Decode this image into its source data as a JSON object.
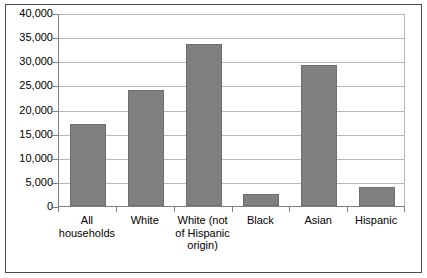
{
  "chart_data": {
    "type": "bar",
    "title": "",
    "subtitle": "",
    "xlabel": "",
    "ylabel": "",
    "categories": [
      "All households",
      "White",
      "White (not of Hispanic origin)",
      "Black",
      "Asian",
      "Hispanic"
    ],
    "category_lines": [
      [
        "All",
        "households"
      ],
      [
        "White"
      ],
      [
        "White (not",
        "of Hispanic",
        "origin)"
      ],
      [
        "Black"
      ],
      [
        "Asian"
      ],
      [
        "Hispanic"
      ]
    ],
    "values": [
      17000,
      24000,
      33500,
      2500,
      29200,
      4000
    ],
    "ylim": [
      0,
      40000
    ],
    "ytick_values": [
      0,
      5000,
      10000,
      15000,
      20000,
      25000,
      30000,
      35000,
      40000
    ],
    "ytick_labels": [
      "0",
      "5,000",
      "10,000",
      "15,000",
      "20,000",
      "25,000",
      "30,000",
      "35,000",
      "40,000"
    ],
    "grid": true,
    "legend": false,
    "legend_position": "none",
    "series": [
      {
        "name": "Median net worth",
        "values": [
          17000,
          24000,
          33500,
          2500,
          29200,
          4000
        ],
        "color": "#808080"
      }
    ],
    "colors": {
      "bar_fill": "#808080",
      "bar_border": "#6e6e6e",
      "gridline": "#b9b9b9",
      "axis": "#808080",
      "frame": "#4a4a4a",
      "background": "#ffffff",
      "text": "#000000"
    }
  }
}
